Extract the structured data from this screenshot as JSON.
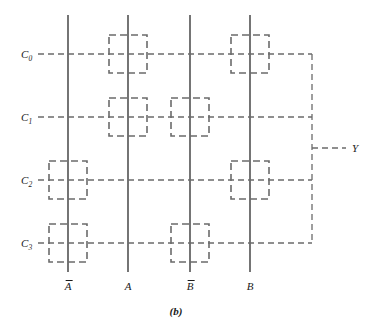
{
  "figure": {
    "caption": "(b)",
    "caption_x": 176,
    "caption_y": 305,
    "width": 373,
    "height": 329,
    "line_color": "#3a3a3a",
    "dash_color": "#6b6b6b",
    "text_color": "#1a1a1a"
  },
  "geometry": {
    "vline_top": 15,
    "vline_bottom": 272,
    "hline_left": 38,
    "bus_x": 312,
    "cell_size": 38,
    "output_branch_y": 148,
    "output_label_x": 352
  },
  "rows": [
    {
      "id": "C0",
      "base": "C",
      "sub": "0",
      "y": 54,
      "label_x": 32
    },
    {
      "id": "C1",
      "base": "C",
      "sub": "1",
      "y": 117,
      "label_x": 32
    },
    {
      "id": "C2",
      "base": "C",
      "sub": "2",
      "y": 180,
      "label_x": 32
    },
    {
      "id": "C3",
      "base": "C",
      "sub": "3",
      "y": 243,
      "label_x": 32
    }
  ],
  "columns": [
    {
      "id": "Anot",
      "label": "A",
      "overbar": true,
      "x": 68,
      "label_y": 281
    },
    {
      "id": "A",
      "label": "A",
      "overbar": false,
      "x": 128,
      "label_y": 281
    },
    {
      "id": "Bnot",
      "label": "B",
      "overbar": true,
      "x": 190,
      "label_y": 281
    },
    {
      "id": "B",
      "label": "B",
      "overbar": false,
      "x": 250,
      "label_y": 281
    }
  ],
  "cells": [
    {
      "row": "C0",
      "col": "A",
      "x": 128,
      "y": 54
    },
    {
      "row": "C0",
      "col": "B",
      "x": 250,
      "y": 54
    },
    {
      "row": "C1",
      "col": "A",
      "x": 128,
      "y": 117
    },
    {
      "row": "C1",
      "col": "Bnot",
      "x": 190,
      "y": 117
    },
    {
      "row": "C2",
      "col": "Anot",
      "x": 68,
      "y": 180
    },
    {
      "row": "C2",
      "col": "B",
      "x": 250,
      "y": 180
    },
    {
      "row": "C3",
      "col": "Anot",
      "x": 68,
      "y": 243
    },
    {
      "row": "C3",
      "col": "Bnot",
      "x": 190,
      "y": 243
    }
  ],
  "output": {
    "id": "Y",
    "label": "Y"
  }
}
